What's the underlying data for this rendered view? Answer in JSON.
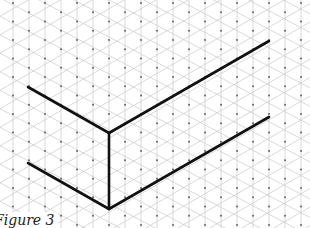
{
  "figure": {
    "caption": "Figure 3"
  },
  "grid": {
    "type": "isometric",
    "spacing_x": 16,
    "spacing_y": 18.5,
    "origin_x": 13,
    "origin_y": 3,
    "line_color": "#c8c8c8",
    "dot_color": "#555555"
  },
  "drawing": {
    "stroke_color": "#111111",
    "stroke_width": 2.6,
    "segments": [
      {
        "name": "upper-left-edge",
        "x1": 28,
        "y1": 87,
        "x2": 109,
        "y2": 133
      },
      {
        "name": "upper-right-edge",
        "x1": 109,
        "y1": 133,
        "x2": 269,
        "y2": 41
      },
      {
        "name": "vertical-edge",
        "x1": 109,
        "y1": 133,
        "x2": 109,
        "y2": 209
      },
      {
        "name": "lower-left-edge",
        "x1": 28,
        "y1": 163,
        "x2": 109,
        "y2": 209
      },
      {
        "name": "lower-right-edge",
        "x1": 109,
        "y1": 209,
        "x2": 269,
        "y2": 117
      }
    ]
  }
}
